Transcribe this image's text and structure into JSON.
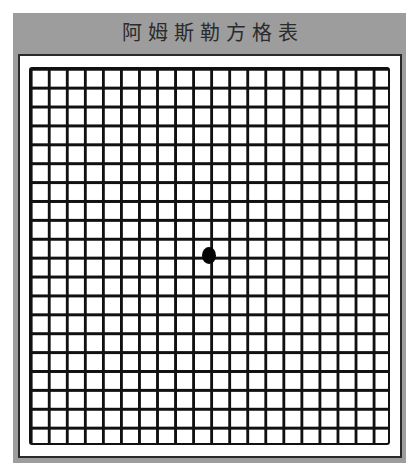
{
  "chart": {
    "title": "阿姆斯勒方格表",
    "grid": {
      "columns": 20,
      "rows": 20,
      "line_color": "#111111",
      "background": "#ffffff"
    },
    "fixation_dot": {
      "color": "#050505",
      "position": "center"
    },
    "colors": {
      "frame": "#9d9d9d",
      "title_text": "#2b2b2b",
      "panel_border": "#2a2a2a"
    }
  }
}
